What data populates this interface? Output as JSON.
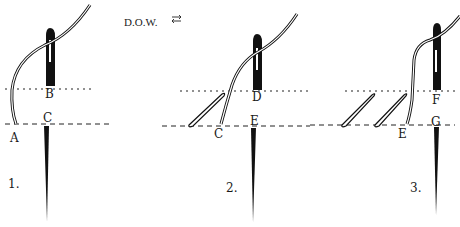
{
  "title": "D.O.W.",
  "title_icon": "left-right-arrows-icon",
  "colors": {
    "ink": "#111111",
    "background": "#ffffff"
  },
  "steps": [
    {
      "number": "1.",
      "labels": {
        "a": "A",
        "b": "B",
        "c": "C"
      }
    },
    {
      "number": "2.",
      "labels": {
        "c": "C",
        "d": "D",
        "e": "E"
      }
    },
    {
      "number": "3.",
      "labels": {
        "e": "E",
        "f": "F",
        "g": "G"
      }
    }
  ]
}
